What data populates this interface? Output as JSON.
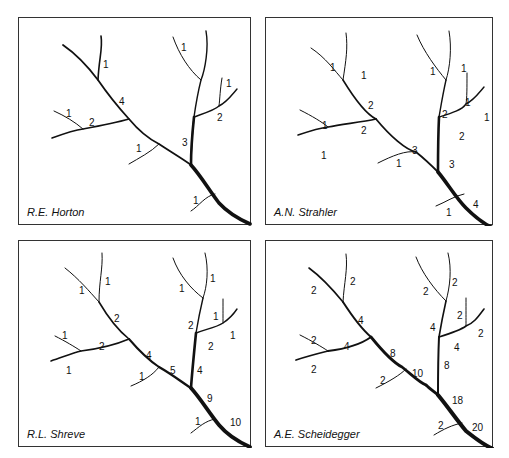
{
  "figure": {
    "panels": [
      {
        "id": "horton",
        "caption": "R.E. Horton",
        "labels": [
          "1",
          "4",
          "1",
          "2",
          "1",
          "3",
          "1",
          "1",
          "2",
          "1"
        ]
      },
      {
        "id": "strahler",
        "caption": "A.N. Strahler",
        "labels": [
          "1",
          "1",
          "2",
          "1",
          "2",
          "1",
          "3",
          "1",
          "1",
          "1",
          "2",
          "1",
          "1",
          "2",
          "3",
          "1",
          "4"
        ]
      },
      {
        "id": "shreve",
        "caption": "R.L. Shreve",
        "labels": [
          "1",
          "1",
          "2",
          "1",
          "2",
          "1",
          "4",
          "1",
          "5",
          "1",
          "1",
          "2",
          "1",
          "1",
          "2",
          "4",
          "9",
          "1",
          "10"
        ]
      },
      {
        "id": "scheidegger",
        "caption": "A.E. Scheidegger",
        "labels": [
          "2",
          "2",
          "4",
          "2",
          "4",
          "2",
          "8",
          "2",
          "10",
          "2",
          "2",
          "4",
          "2",
          "2",
          "4",
          "8",
          "18",
          "2",
          "20"
        ]
      }
    ]
  }
}
